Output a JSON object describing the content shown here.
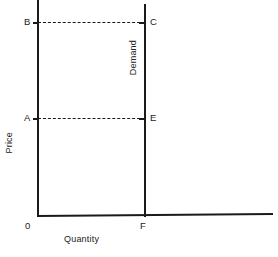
{
  "chart_data": {
    "type": "line",
    "title": "",
    "subtitle": "",
    "xlabel": "Quantity",
    "ylabel": "Price",
    "grid": false,
    "legend_position": "inline",
    "xlim": [
      0,
      1
    ],
    "ylim": [
      0,
      1
    ],
    "series": [
      {
        "name": "Demand",
        "description": "Perfectly inelastic demand: vertical line at quantity F",
        "x": [
          0.88,
          0.88
        ],
        "y": [
          0.0,
          1.0
        ]
      }
    ],
    "guide_lines": [
      {
        "name": "price-B-to-C",
        "style": "dashed",
        "from": "B",
        "to": "C",
        "y": 0.9
      },
      {
        "name": "price-A-to-E",
        "style": "dashed",
        "from": "A",
        "to": "E",
        "y": 0.455
      }
    ],
    "annotations": [
      {
        "label": "B",
        "x": 0.0,
        "y": 0.9,
        "note": "high price on price axis"
      },
      {
        "label": "C",
        "x": 0.88,
        "y": 0.9,
        "note": "quantity demanded at high price"
      },
      {
        "label": "A",
        "x": 0.0,
        "y": 0.455,
        "note": "low price on price axis"
      },
      {
        "label": "E",
        "x": 0.88,
        "y": 0.455,
        "note": "quantity demanded at low price"
      },
      {
        "label": "0",
        "x": 0.0,
        "y": 0.0,
        "note": "origin"
      },
      {
        "label": "F",
        "x": 0.88,
        "y": 0.0,
        "note": "fixed quantity on quantity axis"
      },
      {
        "label": "Demand",
        "x": 0.83,
        "y": 0.72,
        "note": "curve label, rotated vertically"
      }
    ],
    "colors": {
      "line": "#1a1a1a",
      "axis": "#1a1a1a",
      "background": "#ffffff",
      "text": "#222222"
    }
  },
  "axes": {
    "y_title": "Price",
    "x_title": "Quantity"
  },
  "curve": {
    "label": "Demand"
  },
  "points": {
    "b": "B",
    "c": "C",
    "a": "A",
    "e": "E",
    "origin": "0",
    "f": "F"
  }
}
